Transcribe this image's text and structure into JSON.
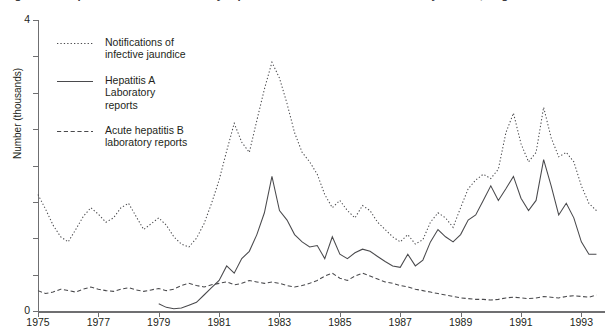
{
  "figure": {
    "title_clipped": "Figure 2.4  Hepatitis A and B: laboratory reports and notifications of infective jaundice, England and Wales",
    "ylabel": "Number (thousands)"
  },
  "legend": {
    "position": "inside-top-left",
    "items": [
      {
        "name": "notifications-infective-jaundice",
        "style": "dotted",
        "lines": [
          "Notifications of",
          "infective jaundice"
        ]
      },
      {
        "name": "hepatitis-a-laboratory-reports",
        "style": "solid",
        "lines": [
          "Hepatitis A",
          "Laboratory",
          "reports"
        ]
      },
      {
        "name": "acute-hepatitis-b-laboratory-reports",
        "style": "dashed",
        "lines": [
          "Acute hepatitis B",
          "laboratory reports"
        ]
      }
    ]
  },
  "axes": {
    "y": {
      "label": "Number (thousands)",
      "min": 0,
      "max": 4,
      "major_ticks": [
        0,
        4
      ],
      "major_tick_labels": [
        "0",
        "4"
      ],
      "minor_tick_step": 0.5,
      "minor_ticks": [
        0.5,
        1,
        1.5,
        2,
        2.5,
        3,
        3.5
      ]
    },
    "x": {
      "min": 1975,
      "max": 1993.75,
      "tick_labels": [
        "1975",
        "1977",
        "1979",
        "1981",
        "1983",
        "1985",
        "1987",
        "1989",
        "1991",
        "1993"
      ],
      "tick_values": [
        1975,
        1977,
        1979,
        1981,
        1983,
        1985,
        1987,
        1989,
        1991,
        1993
      ]
    },
    "grid": false
  },
  "colors": {
    "line": "#4a4a4d",
    "axis": "#6f6f71",
    "text": "#231f20",
    "background": "#ffffff"
  },
  "chart_data": {
    "type": "line",
    "title": "Hepatitis A and B: laboratory reports and notifications of infective jaundice",
    "xlabel": "",
    "ylabel": "Number (thousands)",
    "xlim": [
      1975,
      1993.75
    ],
    "ylim": [
      0,
      4
    ],
    "grid": false,
    "legend_position": "inside-top-left",
    "x_unit": "quarter",
    "x": [
      1975.0,
      1975.25,
      1975.5,
      1975.75,
      1976.0,
      1976.25,
      1976.5,
      1976.75,
      1977.0,
      1977.25,
      1977.5,
      1977.75,
      1978.0,
      1978.25,
      1978.5,
      1978.75,
      1979.0,
      1979.25,
      1979.5,
      1979.75,
      1980.0,
      1980.25,
      1980.5,
      1980.75,
      1981.0,
      1981.25,
      1981.5,
      1981.75,
      1982.0,
      1982.25,
      1982.5,
      1982.75,
      1983.0,
      1983.25,
      1983.5,
      1983.75,
      1984.0,
      1984.25,
      1984.5,
      1984.75,
      1985.0,
      1985.25,
      1985.5,
      1985.75,
      1986.0,
      1986.25,
      1986.5,
      1986.75,
      1987.0,
      1987.25,
      1987.5,
      1987.75,
      1988.0,
      1988.25,
      1988.5,
      1988.75,
      1989.0,
      1989.25,
      1989.5,
      1989.75,
      1990.0,
      1990.25,
      1990.5,
      1990.75,
      1991.0,
      1991.25,
      1991.5,
      1991.75,
      1992.0,
      1992.25,
      1992.5,
      1992.75,
      1993.0,
      1993.25,
      1993.5
    ],
    "series": [
      {
        "name": "Notifications of infective jaundice",
        "style": "dotted",
        "values": [
          1.6,
          1.4,
          1.18,
          1.02,
          0.95,
          1.12,
          1.3,
          1.42,
          1.33,
          1.22,
          1.28,
          1.42,
          1.48,
          1.3,
          1.12,
          1.2,
          1.28,
          1.18,
          1.02,
          0.92,
          0.88,
          1.0,
          1.2,
          1.48,
          1.8,
          2.2,
          2.58,
          2.32,
          2.18,
          2.62,
          3.05,
          3.42,
          3.2,
          2.85,
          2.45,
          2.18,
          2.05,
          1.88,
          1.6,
          1.42,
          1.52,
          1.38,
          1.28,
          1.45,
          1.38,
          1.22,
          1.12,
          1.02,
          0.95,
          1.05,
          0.92,
          0.98,
          1.22,
          1.35,
          1.28,
          1.15,
          1.42,
          1.68,
          1.8,
          1.88,
          1.82,
          1.95,
          2.45,
          2.72,
          2.3,
          2.05,
          2.18,
          2.8,
          2.38,
          2.12,
          2.18,
          2.05,
          1.72,
          1.48,
          1.38
        ]
      },
      {
        "name": "Hepatitis A Laboratory reports",
        "style": "solid",
        "values": [
          null,
          null,
          null,
          null,
          null,
          null,
          null,
          null,
          null,
          null,
          null,
          null,
          null,
          null,
          null,
          null,
          0.1,
          0.05,
          0.03,
          0.04,
          0.08,
          0.12,
          0.22,
          0.32,
          0.42,
          0.62,
          0.52,
          0.72,
          0.82,
          1.05,
          1.35,
          1.85,
          1.38,
          1.25,
          1.05,
          0.95,
          0.88,
          0.9,
          0.72,
          1.02,
          0.78,
          0.72,
          0.8,
          0.85,
          0.82,
          0.75,
          0.68,
          0.62,
          0.6,
          0.78,
          0.62,
          0.7,
          0.95,
          1.12,
          1.02,
          0.95,
          1.05,
          1.25,
          1.32,
          1.52,
          1.72,
          1.52,
          1.68,
          1.85,
          1.55,
          1.38,
          1.52,
          2.08,
          1.72,
          1.32,
          1.48,
          1.28,
          0.95,
          0.78,
          0.78
        ]
      },
      {
        "name": "Acute hepatitis B laboratory reports",
        "style": "dashed",
        "values": [
          0.28,
          0.24,
          0.26,
          0.3,
          0.28,
          0.26,
          0.3,
          0.33,
          0.3,
          0.28,
          0.27,
          0.3,
          0.32,
          0.29,
          0.27,
          0.29,
          0.31,
          0.28,
          0.3,
          0.35,
          0.38,
          0.35,
          0.33,
          0.36,
          0.38,
          0.4,
          0.36,
          0.38,
          0.42,
          0.4,
          0.38,
          0.4,
          0.38,
          0.35,
          0.33,
          0.35,
          0.38,
          0.42,
          0.48,
          0.52,
          0.45,
          0.42,
          0.48,
          0.52,
          0.48,
          0.44,
          0.4,
          0.38,
          0.35,
          0.33,
          0.3,
          0.28,
          0.26,
          0.24,
          0.22,
          0.2,
          0.18,
          0.17,
          0.16,
          0.16,
          0.15,
          0.16,
          0.18,
          0.19,
          0.18,
          0.17,
          0.18,
          0.2,
          0.19,
          0.18,
          0.2,
          0.21,
          0.2,
          0.19,
          0.22
        ]
      }
    ]
  }
}
